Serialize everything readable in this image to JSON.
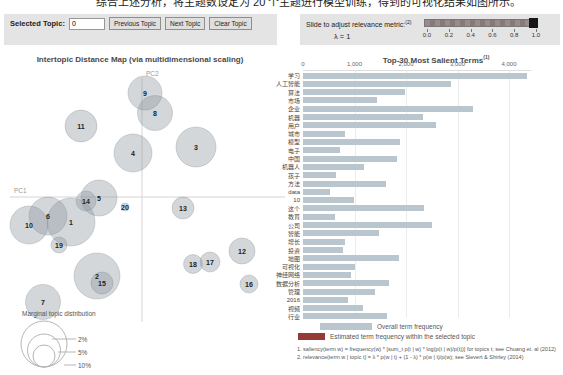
{
  "top_caption": "综合上述分析，将主题数设定为 20 个主题进行模型训练，得到的可视化结果如图所示。",
  "controls": {
    "label": "Selected Topic:",
    "topic_value": "0",
    "buttons": [
      "Previous Topic",
      "Next Topic",
      "Clear Topic"
    ]
  },
  "slider": {
    "label": "Slide to adjust relevance metric:",
    "label_sup": "(2)",
    "lambda": "λ = 1",
    "value": 1,
    "ticks": [
      "0.0",
      "0.2",
      "0.4",
      "0.6",
      "0.8",
      "1.0"
    ]
  },
  "map": {
    "title": "Intertopic Distance Map (via multidimensional scaling)",
    "x_axis_label": "PC1",
    "y_axis_label": "PC2",
    "topics": [
      {
        "id": 1,
        "x": 71,
        "y": 222,
        "r": 24
      },
      {
        "id": 2,
        "x": 97,
        "y": 276,
        "r": 23
      },
      {
        "id": 3,
        "x": 196,
        "y": 147,
        "r": 20
      },
      {
        "id": 4,
        "x": 133,
        "y": 153,
        "r": 19
      },
      {
        "id": 5,
        "x": 99,
        "y": 198,
        "r": 18
      },
      {
        "id": 6,
        "x": 48,
        "y": 216,
        "r": 19
      },
      {
        "id": 7,
        "x": 43,
        "y": 302,
        "r": 17.5
      },
      {
        "id": 8,
        "x": 155,
        "y": 113,
        "r": 17.5
      },
      {
        "id": 9,
        "x": 145,
        "y": 93,
        "r": 17
      },
      {
        "id": 10,
        "x": 29,
        "y": 225,
        "r": 19
      },
      {
        "id": 11,
        "x": 81,
        "y": 126,
        "r": 16
      },
      {
        "id": 12,
        "x": 242,
        "y": 251,
        "r": 13
      },
      {
        "id": 13,
        "x": 183,
        "y": 208,
        "r": 11
      },
      {
        "id": 14,
        "x": 86,
        "y": 201,
        "r": 10
      },
      {
        "id": 15,
        "x": 102,
        "y": 283,
        "r": 11
      },
      {
        "id": 16,
        "x": 249,
        "y": 284,
        "r": 9
      },
      {
        "id": 17,
        "x": 210,
        "y": 262,
        "r": 10
      },
      {
        "id": 18,
        "x": 193,
        "y": 264,
        "r": 9.5
      },
      {
        "id": 19,
        "x": 59,
        "y": 245,
        "r": 8
      },
      {
        "id": 20,
        "x": 125,
        "y": 207,
        "r": 4
      }
    ],
    "legend": {
      "title": "Marginal topic distribution",
      "sizes": [
        {
          "label": "2%"
        },
        {
          "label": "5%"
        },
        {
          "label": "10%"
        }
      ]
    }
  },
  "chart_data": {
    "type": "bar",
    "title": "Top-30 Most Salient Terms",
    "title_sup": "(1)",
    "categories": [
      "学习",
      "人工智能",
      "算法",
      "市场",
      "企业",
      "机器",
      "用户",
      "城市",
      "模型",
      "电子",
      "中国",
      "机器人",
      "孩子",
      "方法",
      "data",
      "10",
      "这个",
      "教育",
      "公司",
      "智能",
      "增长",
      "投资",
      "地图",
      "可视化",
      "神经网络",
      "数据分析",
      "管理",
      "2016",
      "视频",
      "行业"
    ],
    "values": [
      4400,
      2900,
      2000,
      1450,
      3330,
      2350,
      2610,
      820,
      1900,
      725,
      1840,
      1200,
      640,
      1630,
      530,
      1000,
      2370,
      630,
      2530,
      1490,
      820,
      780,
      1880,
      1020,
      940,
      1690,
      1410,
      880,
      1180,
      1650
    ],
    "xticks": [
      "0",
      "1,000",
      "2,000",
      "3,000",
      "4,000"
    ],
    "xlim": [
      0,
      4500
    ],
    "grid": true,
    "legend_position": "bottom",
    "legend": [
      {
        "label": "Overall term frequency",
        "color": "#b9c6ce"
      },
      {
        "label": "Estimated term frequency within the selected topic",
        "color": "#963a35"
      }
    ],
    "footnotes": [
      "1. saliency(term w) = frequency(w) * [sum_t p(t | w) * log(p(t | w)/p(t))] for topics t; see Chuang et. al (2012)",
      "2. relevance(term w | topic t) = λ * p(w | t) + (1 - λ) * p(w | t)/p(w); see Sievert & Shirley (2014)"
    ]
  },
  "colors": {
    "panel_bg": "#e4e4e4",
    "bar": "#b9c6ce",
    "selected": "#963a35",
    "circle_fill": "rgba(140,150,158,0.38)",
    "circle_stroke": "rgba(115,126,135,0.55)"
  }
}
